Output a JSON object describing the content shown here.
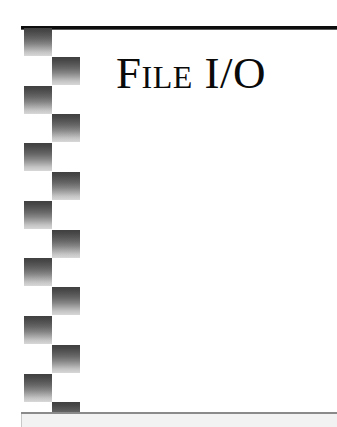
{
  "page": {
    "width": 337,
    "height": 427,
    "background_color": "#ffffff",
    "kind": "book-chapter-opener"
  },
  "title": {
    "text": "File I/O",
    "style": "small-caps serif",
    "color": "#0a0a0a"
  },
  "decorations": {
    "top_rule": {
      "name": "top-rule",
      "color": "#0d0d0d"
    },
    "bottom_rule": {
      "name": "bottom-rule",
      "color": "#8a8a8a",
      "band_color": "#f2f2f2"
    },
    "checkerboard": {
      "name": "checkerboard-ornament",
      "columns": 2,
      "rows": 13,
      "square_size": 28,
      "gradient_top_color": "#121212",
      "gradient_bottom_color": "#cfcfcf",
      "pattern": [
        "left",
        "right",
        "left",
        "right",
        "left",
        "right",
        "left",
        "right",
        "left",
        "right",
        "left",
        "right",
        "left",
        "right"
      ]
    }
  }
}
